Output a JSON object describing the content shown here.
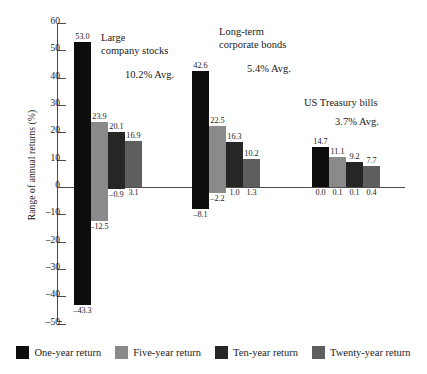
{
  "chart_data": {
    "type": "bar",
    "title": "",
    "xlabel": "",
    "ylabel": "Range of annual returns (%)",
    "ylim": [
      -50,
      60
    ],
    "ytick_step": 10,
    "yticks": [
      60,
      50,
      40,
      30,
      20,
      10,
      0,
      "–10",
      "–20",
      "–30",
      "–40",
      "–50"
    ],
    "grid": false,
    "legend_position": "bottom",
    "series": [
      {
        "name": "One-year return",
        "color": "#0d0d0d"
      },
      {
        "name": "Five-year return",
        "color": "#8a8a8a"
      },
      {
        "name": "Ten-year return",
        "color": "#262626"
      },
      {
        "name": "Twenty-year return",
        "color": "#5e5e5e"
      }
    ],
    "categories": [
      "Large company stocks",
      "Long-term corporate bonds",
      "US Treasury bills"
    ],
    "groups": [
      {
        "title_line1": "Large",
        "title_line2": "company stocks",
        "average_label": "10.2% Avg.",
        "bars": [
          {
            "series": "One-year return",
            "max": 53.0,
            "min": -43.3,
            "max_label": "53.0",
            "min_label": "–43.3"
          },
          {
            "series": "Five-year return",
            "max": 23.9,
            "min": -12.5,
            "max_label": "23.9",
            "min_label": "–12.5"
          },
          {
            "series": "Ten-year return",
            "max": 20.1,
            "min": -0.9,
            "max_label": "20.1",
            "min_label": "–0.9"
          },
          {
            "series": "Twenty-year return",
            "max": 16.9,
            "min": 3.1,
            "max_label": "16.9",
            "min_label": "3.1"
          }
        ]
      },
      {
        "title_line1": "Long-term",
        "title_line2": "corporate bonds",
        "average_label": "5.4% Avg.",
        "bars": [
          {
            "series": "One-year return",
            "max": 42.6,
            "min": -8.1,
            "max_label": "42.6",
            "min_label": "–8.1"
          },
          {
            "series": "Five-year return",
            "max": 22.5,
            "min": -2.2,
            "max_label": "22.5",
            "min_label": "–2.2"
          },
          {
            "series": "Ten-year return",
            "max": 16.3,
            "min": 1.0,
            "max_label": "16.3",
            "min_label": "1.0"
          },
          {
            "series": "Twenty-year return",
            "max": 10.2,
            "min": 1.3,
            "max_label": "10.2",
            "min_label": "1.3"
          }
        ]
      },
      {
        "title_line1": "US Treasury bills",
        "title_line2": "",
        "average_label": "3.7% Avg.",
        "bars": [
          {
            "series": "One-year return",
            "max": 14.7,
            "min": 0.0,
            "max_label": "14.7",
            "min_label": "0.0"
          },
          {
            "series": "Five-year return",
            "max": 11.1,
            "min": 0.1,
            "max_label": "11.1",
            "min_label": "0.1"
          },
          {
            "series": "Ten-year return",
            "max": 9.2,
            "min": 0.1,
            "max_label": "9.2",
            "min_label": "0.1"
          },
          {
            "series": "Twenty-year return",
            "max": 7.7,
            "min": 0.4,
            "max_label": "7.7",
            "min_label": "0.4"
          }
        ]
      }
    ]
  },
  "legend": {
    "items": [
      {
        "label": "One-year return",
        "color": "#0d0d0d"
      },
      {
        "label": "Five-year return",
        "color": "#8a8a8a"
      },
      {
        "label": "Ten-year return",
        "color": "#262626"
      },
      {
        "label": "Twenty-year return",
        "color": "#5e5e5e"
      }
    ]
  }
}
